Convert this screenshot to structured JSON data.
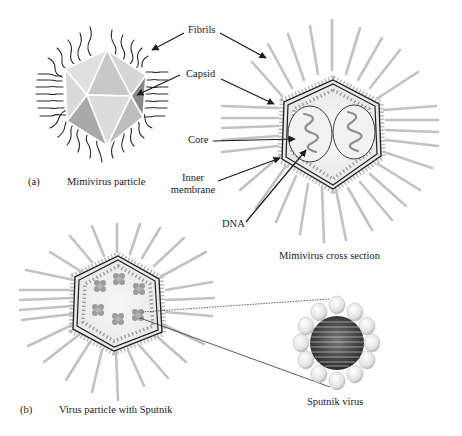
{
  "figure": {
    "panels": [
      {
        "id": "a",
        "marker": "(a)"
      },
      {
        "id": "b",
        "marker": "(b)"
      }
    ],
    "captions": {
      "mimivirus_particle": "Mimivirus particle",
      "mimivirus_cross_section": "Mimivirus cross section",
      "virus_with_sputnik": "Virus particle with Sputnik",
      "sputnik_virus": "Sputnik virus"
    },
    "labels": {
      "fibrils": "Fibrils",
      "capsid": "Capsid",
      "core": "Core",
      "inner_membrane_line1": "Inner",
      "inner_membrane_line2": "membrane",
      "dna": "DNA"
    },
    "colors": {
      "background": "#ffffff",
      "text": "#1a1a1a",
      "fibril_gray": "#bdbdbd",
      "capsid_outline": "#222222",
      "capsid_face_light": "#e4e4e4",
      "capsid_face_mid": "#c4c4c4",
      "capsid_face_dark": "#8f8f8f",
      "interior_fill": "#f1f1f1",
      "dot_gray": "#9a9a9a"
    }
  }
}
